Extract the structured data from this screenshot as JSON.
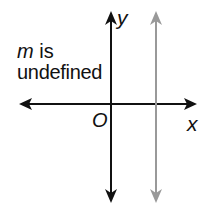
{
  "labels": {
    "slope_var": "m",
    "slope_text": " is",
    "undefined": "undefined",
    "y_axis": "y",
    "origin": "O",
    "x_axis": "x"
  },
  "colors": {
    "axes": "#111111",
    "vertical_line": "#999999",
    "background": "#ffffff"
  },
  "geometry": {
    "y_axis_x": 111,
    "x_axis_y": 104,
    "vertical_line_x": 156
  }
}
